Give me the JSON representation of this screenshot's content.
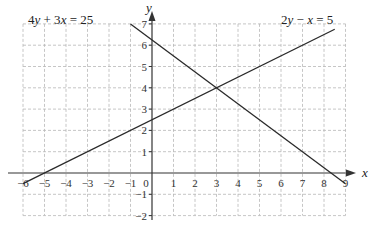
{
  "chart_data": {
    "type": "line",
    "title": "",
    "xlabel": "x",
    "ylabel": "y",
    "xlim": [
      -6,
      9
    ],
    "ylim": [
      -2,
      7
    ],
    "grid": true,
    "x_ticks": [
      -6,
      -5,
      -4,
      -3,
      -2,
      -1,
      0,
      1,
      2,
      3,
      4,
      5,
      6,
      7,
      8,
      9
    ],
    "y_ticks": [
      -2,
      -1,
      1,
      2,
      3,
      4,
      5,
      6,
      7
    ],
    "origin_label": "0",
    "series": [
      {
        "name": "4y + 3x = 25",
        "label_parts": [
          "4",
          "y",
          " + 3",
          "x",
          " = 25"
        ],
        "x": [
          -1,
          9
        ],
        "y": [
          7,
          -0.5
        ]
      },
      {
        "name": "2y − x = 5",
        "label_parts": [
          "2",
          "y",
          " − ",
          "x",
          " = 5"
        ],
        "x": [
          -6,
          8.5
        ],
        "y": [
          -0.5,
          6.75
        ]
      }
    ],
    "intersection": {
      "x": 3,
      "y": 4
    }
  }
}
